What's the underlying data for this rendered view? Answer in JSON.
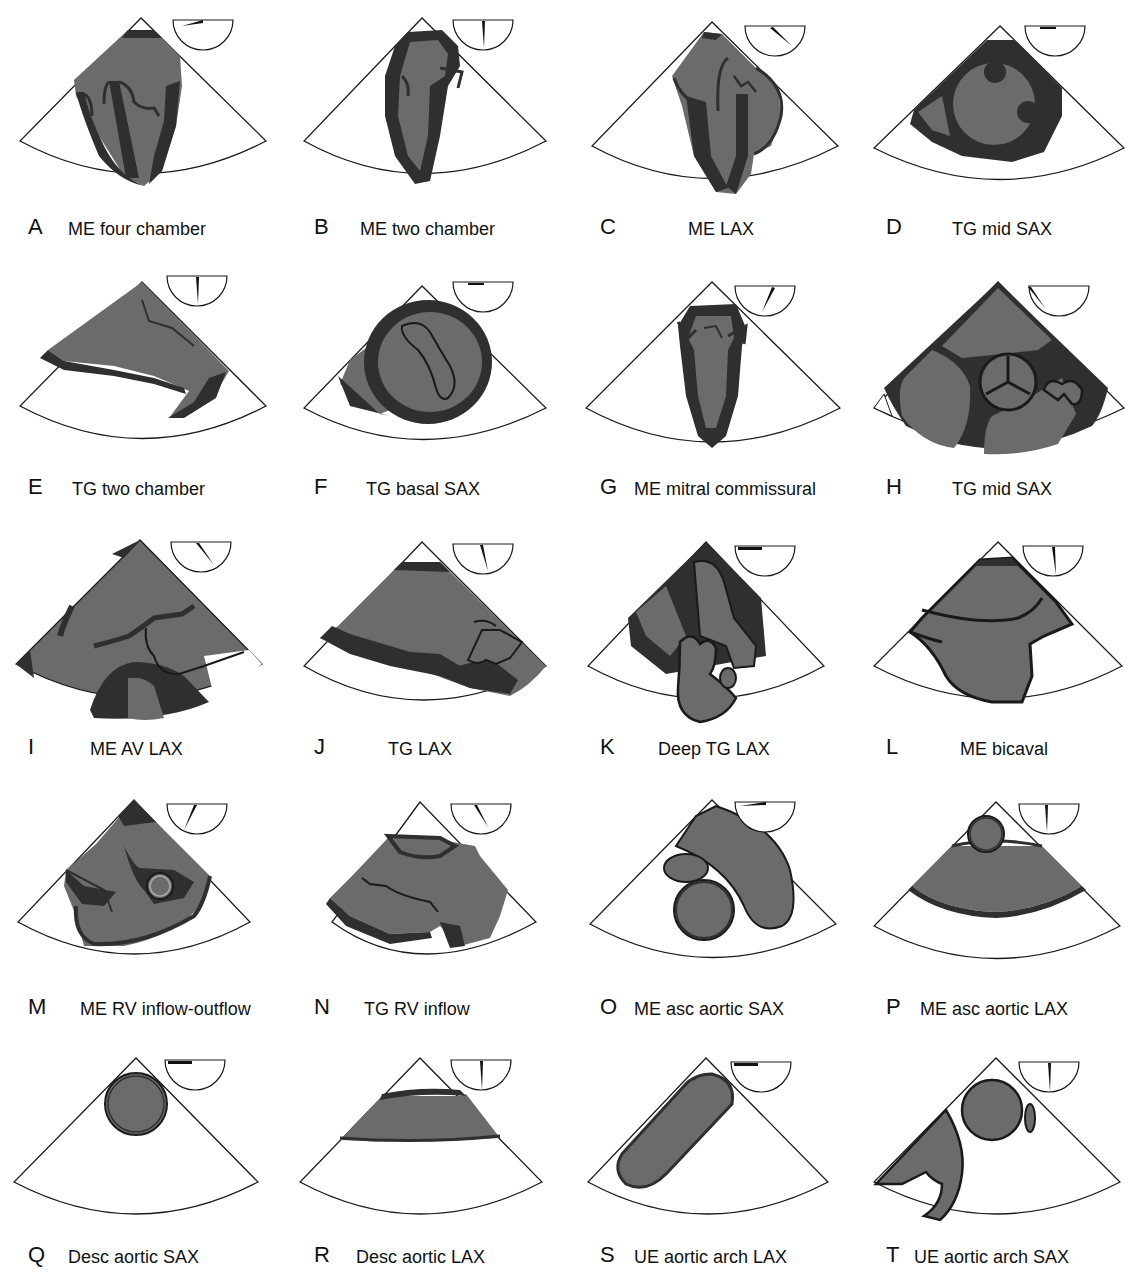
{
  "figure": {
    "colors": {
      "background": "#ffffff",
      "sector_fill": "#ffffff",
      "outline": "#1a1a1a",
      "chamber_gray": "#6b6b6b",
      "wall_dark": "#2f2f2f"
    },
    "panels": [
      {
        "letter": "A",
        "title": "ME four chamber",
        "angle_deg": 10
      },
      {
        "letter": "B",
        "title": "ME two chamber",
        "angle_deg": 85
      },
      {
        "letter": "C",
        "title": "ME LAX",
        "angle_deg": 135
      },
      {
        "letter": "D",
        "title": "TG mid SAX",
        "angle_deg": 0
      },
      {
        "letter": "E",
        "title": "TG two chamber",
        "angle_deg": 90
      },
      {
        "letter": "F",
        "title": "TG basal SAX",
        "angle_deg": 0
      },
      {
        "letter": "G",
        "title": "ME mitral commissural",
        "angle_deg": 60
      },
      {
        "letter": "H",
        "title": "TG mid SAX",
        "angle_deg": 45
      },
      {
        "letter": "I",
        "title": "ME AV LAX",
        "angle_deg": 130
      },
      {
        "letter": "J",
        "title": "TG LAX",
        "angle_deg": 110
      },
      {
        "letter": "K",
        "title": "Deep TG LAX",
        "angle_deg": 0
      },
      {
        "letter": "L",
        "title": "ME bicaval",
        "angle_deg": 100
      },
      {
        "letter": "M",
        "title": "ME RV inflow-outflow",
        "angle_deg": 70
      },
      {
        "letter": "N",
        "title": "TG RV inflow",
        "angle_deg": 115
      },
      {
        "letter": "O",
        "title": "ME asc aortic SAX",
        "angle_deg": 30
      },
      {
        "letter": "P",
        "title": "ME asc aortic LAX",
        "angle_deg": 100
      },
      {
        "letter": "Q",
        "title": "Desc aortic SAX",
        "angle_deg": 0
      },
      {
        "letter": "R",
        "title": "Desc aortic LAX",
        "angle_deg": 90
      },
      {
        "letter": "S",
        "title": "UE aortic arch LAX",
        "angle_deg": 0
      },
      {
        "letter": "T",
        "title": "UE aortic arch SAX",
        "angle_deg": 90
      }
    ]
  }
}
